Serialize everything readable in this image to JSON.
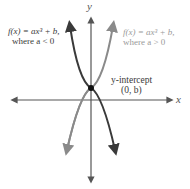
{
  "diagram": {
    "axes": {
      "x_label": "x",
      "y_label": "y"
    },
    "curve_negative": {
      "label_line1": "f(x) = ax³ + b,",
      "label_line2": "where a < 0",
      "color": "#3a3a3a"
    },
    "curve_positive": {
      "label_line1": "f(x) = ax³ + b,",
      "label_line2": "where a > 0",
      "color": "#9a9a9a"
    },
    "intercept": {
      "label_line1": "y-intercept",
      "label_line2": "(0, b)"
    }
  }
}
